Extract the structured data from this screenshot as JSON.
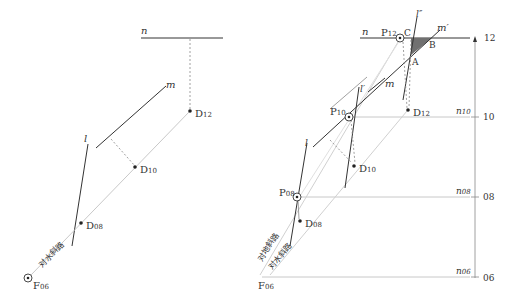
{
  "colors": {
    "line_dark": "#333333",
    "line_light": "#c8c8c8",
    "dotted": "#888888",
    "shade": "#707070",
    "text": "#333333"
  },
  "left": {
    "n_label": "n",
    "m_label": "m",
    "l_label": "l",
    "D12": "D",
    "D12_sub": "12",
    "D10": "D",
    "D10_sub": "10",
    "D08": "D",
    "D08_sub": "08",
    "F06": "F",
    "F06_sub": "06",
    "slope_label": "对水斜路"
  },
  "right": {
    "n_label": "n",
    "m_label": "m",
    "m_prime_label": "m′",
    "l_label": "l",
    "l_prime_label": "l′",
    "l_dprime_label": "l″",
    "P12": "P",
    "P12_sub": "12",
    "P10": "P",
    "P10_sub": "10",
    "P08": "P",
    "P08_sub": "08",
    "D12": "D",
    "D12_sub": "12",
    "D10": "D",
    "D10_sub": "10",
    "D08": "D",
    "D08_sub": "08",
    "F06": "F",
    "F06_sub": "06",
    "A": "A",
    "B": "B",
    "C": "C",
    "n10": "n",
    "n10_sub": "10",
    "n08": "n",
    "n08_sub": "08",
    "n06": "n",
    "n06_sub": "06",
    "slope_label_top": "对地斜路",
    "slope_label_bottom": "对水斜路",
    "axis": {
      "ticks": [
        "12",
        "10",
        "08",
        "06"
      ]
    }
  }
}
